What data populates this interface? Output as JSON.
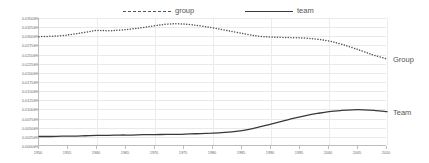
{
  "legend": {
    "items": [
      {
        "label": "group",
        "style": "dashed",
        "color": "#555555"
      },
      {
        "label": "team",
        "style": "solid",
        "color": "#3a3a3a"
      }
    ]
  },
  "series_labels": {
    "group": "Group",
    "team": "Team"
  },
  "chart_data": {
    "type": "line",
    "title": "",
    "xlabel": "",
    "ylabel": "",
    "grid": true,
    "legend_position": "top",
    "xlim": [
      1950,
      2010
    ],
    "ylim": [
      0.0,
      0.0035
    ],
    "y_tick_labels": [
      "0.03500%",
      "0.03250%",
      "0.03000%",
      "0.02750%",
      "0.02500%",
      "0.02250%",
      "0.02000%",
      "0.01750%",
      "0.01500%",
      "0.01250%",
      "0.01000%",
      "0.00750%",
      "0.00500%",
      "0.00250%",
      "0.00000%"
    ],
    "y_tick_values": [
      0.0035,
      0.00325,
      0.003,
      0.00275,
      0.0025,
      0.00225,
      0.002,
      0.00175,
      0.0015,
      0.00125,
      0.001,
      0.00075,
      0.0005,
      0.00025,
      0.0
    ],
    "x_tick_labels": [
      "1950",
      "1955",
      "1960",
      "1965",
      "1970",
      "1975",
      "1980",
      "1985",
      "1990",
      "1995",
      "2000",
      "2005",
      "2010"
    ],
    "x": [
      1950,
      1952,
      1954,
      1956,
      1958,
      1960,
      1962,
      1964,
      1966,
      1968,
      1970,
      1972,
      1974,
      1976,
      1978,
      1980,
      1982,
      1984,
      1986,
      1988,
      1990,
      1992,
      1994,
      1996,
      1998,
      2000,
      2002,
      2004,
      2006,
      2008,
      2010
    ],
    "series": [
      {
        "name": "group",
        "style": "dashed",
        "color": "#555555",
        "values": [
          0.00299,
          0.003,
          0.00302,
          0.00306,
          0.00311,
          0.00316,
          0.00315,
          0.00317,
          0.0032,
          0.00324,
          0.00329,
          0.00333,
          0.00334,
          0.00332,
          0.00328,
          0.00323,
          0.00317,
          0.00311,
          0.00305,
          0.003,
          0.00298,
          0.00297,
          0.00296,
          0.00295,
          0.00292,
          0.00287,
          0.00279,
          0.00269,
          0.00258,
          0.00247,
          0.00238
        ]
      },
      {
        "name": "team",
        "style": "solid",
        "color": "#3a3a3a",
        "values": [
          0.00026,
          0.00026,
          0.00027,
          0.00027,
          0.00028,
          0.00029,
          0.00029,
          0.0003,
          0.0003,
          0.00031,
          0.00031,
          0.00032,
          0.00032,
          0.00033,
          0.00034,
          0.00035,
          0.00037,
          0.0004,
          0.00045,
          0.00052,
          0.0006,
          0.00068,
          0.00076,
          0.00083,
          0.00089,
          0.00094,
          0.00097,
          0.00099,
          0.00099,
          0.00097,
          0.00094
        ]
      }
    ]
  }
}
